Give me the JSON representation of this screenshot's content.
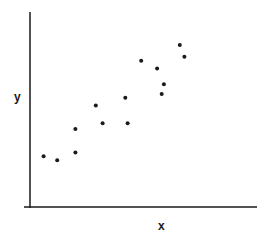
{
  "chart_data": {
    "type": "scatter",
    "title": "",
    "xlabel": "x",
    "ylabel": "y",
    "grid": false,
    "legend": null,
    "xlim": [
      0,
      10
    ],
    "ylim": [
      0,
      10
    ],
    "points": [
      {
        "x": 0.6,
        "y": 2.6
      },
      {
        "x": 1.2,
        "y": 2.4
      },
      {
        "x": 2.0,
        "y": 2.8
      },
      {
        "x": 2.0,
        "y": 4.0
      },
      {
        "x": 2.9,
        "y": 5.2
      },
      {
        "x": 3.2,
        "y": 4.3
      },
      {
        "x": 4.2,
        "y": 5.6
      },
      {
        "x": 4.3,
        "y": 4.3
      },
      {
        "x": 4.9,
        "y": 7.5
      },
      {
        "x": 5.6,
        "y": 7.1
      },
      {
        "x": 5.9,
        "y": 6.3
      },
      {
        "x": 5.8,
        "y": 5.8
      },
      {
        "x": 6.6,
        "y": 8.3
      },
      {
        "x": 6.8,
        "y": 7.7
      }
    ],
    "point_color": "#1a1a1a",
    "axis_color": "#1a1a1a"
  },
  "axes": {
    "x_label": "x",
    "y_label": "y"
  }
}
